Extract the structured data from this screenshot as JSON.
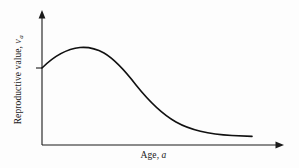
{
  "figure": {
    "background_color": "#fdfdfd",
    "line_color": "#111111",
    "axis_color": "#1a1a1a"
  },
  "axes": {
    "x": {
      "label_prefix": "Age, ",
      "label_variable": "a",
      "full_label": "Age, a",
      "has_arrow": true
    },
    "y": {
      "label_prefix": "Reproductive value, ",
      "label_variable": "v",
      "label_subscript": "a",
      "full_label": "Reproductive value, v_a",
      "has_arrow": true,
      "ticks": [
        {
          "value": "1",
          "label": ""
        }
      ]
    }
  },
  "chart_data": {
    "type": "line",
    "title": "",
    "subtitle": "",
    "xlabel": "Age, a",
    "ylabel": "Reproductive value, v_a",
    "grid": false,
    "legend": false,
    "legend_position": "none",
    "xlim": [
      0,
      10
    ],
    "ylim": [
      0,
      1.6
    ],
    "xticks": [],
    "yticks": [
      1
    ],
    "ytick_labels": [
      "1"
    ],
    "annotations": [
      "Curve begins at reproductive value 1 at age 0",
      "Peak reproductive value occurs at an intermediate young age",
      "Reproductive value declines to a low plateau at old age"
    ],
    "series": [
      {
        "name": "Reproductive value",
        "x": [
          0.0,
          0.5,
          1.0,
          1.5,
          2.0,
          2.5,
          3.0,
          3.5,
          4.0,
          4.5,
          5.0,
          5.5,
          6.0,
          6.5,
          7.0,
          7.5,
          8.0,
          8.5,
          9.0
        ],
        "values": [
          1.0,
          1.14,
          1.25,
          1.32,
          1.35,
          1.34,
          1.28,
          1.18,
          1.04,
          0.88,
          0.71,
          0.56,
          0.43,
          0.33,
          0.26,
          0.21,
          0.18,
          0.16,
          0.15
        ]
      }
    ],
    "svg_path": "M 42 68 C 52 58, 66 49, 80 47.5 C 88 46.8, 96 48.5, 104 53 C 116 60, 126 72, 136 85 C 148 100, 160 113, 176 122 C 192 131, 212 134.5, 232 135.5 C 242 136, 248 136.2, 252 136.4"
  }
}
